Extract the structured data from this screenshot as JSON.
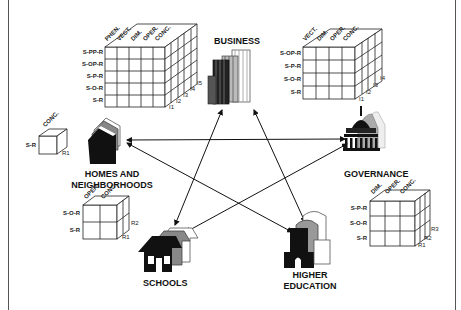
{
  "nodes": {
    "business": {
      "label": "BUSINESS"
    },
    "governance": {
      "label": "GOVERNANCE"
    },
    "homes": {
      "label_line1": "HOMES AND",
      "label_line2": "NEIGHBORHOODS"
    },
    "schools": {
      "label": "SCHOOLS"
    },
    "higher_ed": {
      "label_line1": "HIGHER",
      "label_line2": "EDUCATION"
    }
  },
  "connections": [
    {
      "from": "business",
      "to": "schools"
    },
    {
      "from": "business",
      "to": "higher_ed"
    },
    {
      "from": "homes",
      "to": "governance"
    },
    {
      "from": "homes",
      "to": "higher_ed"
    },
    {
      "from": "governance",
      "to": "schools"
    }
  ],
  "cubes": {
    "business": {
      "rows": [
        "S-PP-R",
        "S-OP-R",
        "S-P-R",
        "S-O-R",
        "S-R"
      ],
      "cols": [
        "PHEN.",
        "VECT.",
        "DIM.",
        "OPER.",
        "CONC."
      ],
      "depth": [
        "I1",
        "I2",
        "I3",
        "I4",
        "I5"
      ]
    },
    "governance": {
      "rows": [
        "S-OP-R",
        "S-P-R",
        "S-O-R",
        "S-R"
      ],
      "cols": [
        "VECT.",
        "DIM.",
        "OPER.",
        "CONC."
      ],
      "depth": [
        "I1",
        "I2",
        "I3",
        "I4"
      ]
    },
    "homes": {
      "rows": [
        "S-R"
      ],
      "cols": [
        "CONC."
      ],
      "depth": [
        "R1"
      ]
    },
    "schools": {
      "rows": [
        "S-O-R",
        "S-R"
      ],
      "cols": [
        "OPER.",
        "CONC."
      ],
      "depth": [
        "R1",
        "R2"
      ]
    },
    "higher_ed": {
      "rows": [
        "S-P-R",
        "S-O-R",
        "S-R"
      ],
      "cols": [
        "DIM.",
        "OPER.",
        "CONC."
      ],
      "depth": [
        "R1",
        "R2",
        "R3"
      ]
    }
  }
}
